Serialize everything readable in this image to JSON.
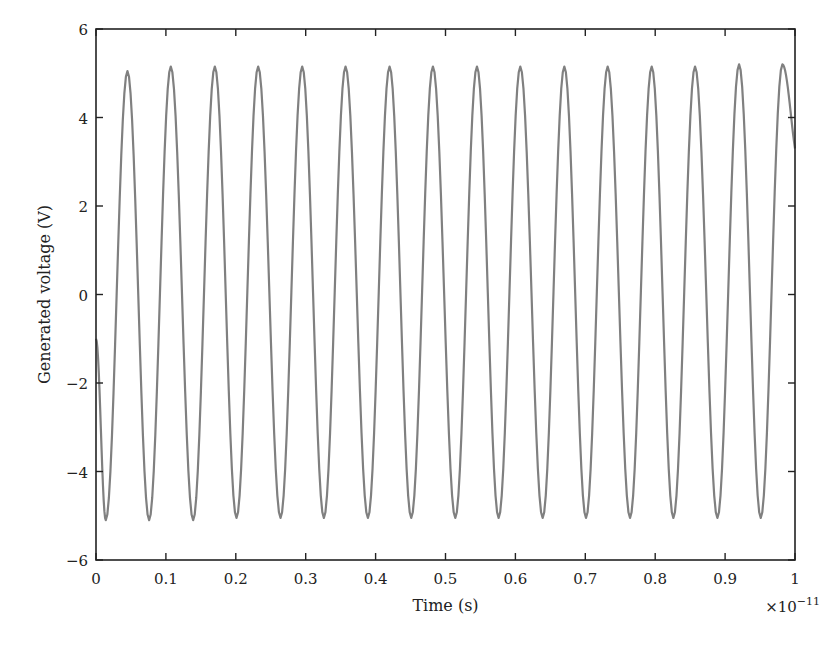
{
  "chart_data": {
    "type": "line",
    "title": "",
    "xlabel": "Time (s)",
    "ylabel": "Generated voltage (V)",
    "x_multiplier": "×10",
    "x_multiplier_exp": "−11",
    "xlim": [
      0,
      1
    ],
    "ylim": [
      -6,
      6
    ],
    "xticks": [
      "0",
      "0.1",
      "0.2",
      "0.3",
      "0.4",
      "0.5",
      "0.6",
      "0.7",
      "0.8",
      "0.9",
      "1"
    ],
    "yticks": [
      "−6",
      "−4",
      "−2",
      "0",
      "2",
      "4",
      "6"
    ],
    "grid": false,
    "legend": null,
    "line_color": "#808080",
    "series": [
      {
        "name": "Generated voltage",
        "description": "Sinusoid, amplitude ~5.1 V, ~16 cycles over 0–1×10^-11 s (period ~0.0625×10^-11 s), starts near −1 V at t=0, first trough ~0.015, first peak ~0.045",
        "amplitude": 5.1,
        "period": 0.0625,
        "phase_start_value": -1.0,
        "peaks_x": [
          0.045,
          0.107,
          0.17,
          0.232,
          0.295,
          0.357,
          0.42,
          0.482,
          0.545,
          0.607,
          0.67,
          0.732,
          0.795,
          0.857,
          0.92,
          0.982
        ],
        "peaks_y": [
          5.05,
          5.15,
          5.15,
          5.15,
          5.15,
          5.15,
          5.15,
          5.15,
          5.15,
          5.15,
          5.15,
          5.15,
          5.15,
          5.15,
          5.2,
          5.2
        ],
        "troughs_x": [
          0.014,
          0.076,
          0.139,
          0.201,
          0.264,
          0.326,
          0.389,
          0.451,
          0.514,
          0.576,
          0.639,
          0.701,
          0.764,
          0.826,
          0.889,
          0.951
        ],
        "troughs_y": [
          -5.1,
          -5.1,
          -5.1,
          -5.05,
          -5.05,
          -5.05,
          -5.05,
          -5.05,
          -5.05,
          -5.05,
          -5.05,
          -5.05,
          -5.05,
          -5.05,
          -5.05,
          -5.05
        ],
        "end_value": 3.3
      }
    ]
  }
}
